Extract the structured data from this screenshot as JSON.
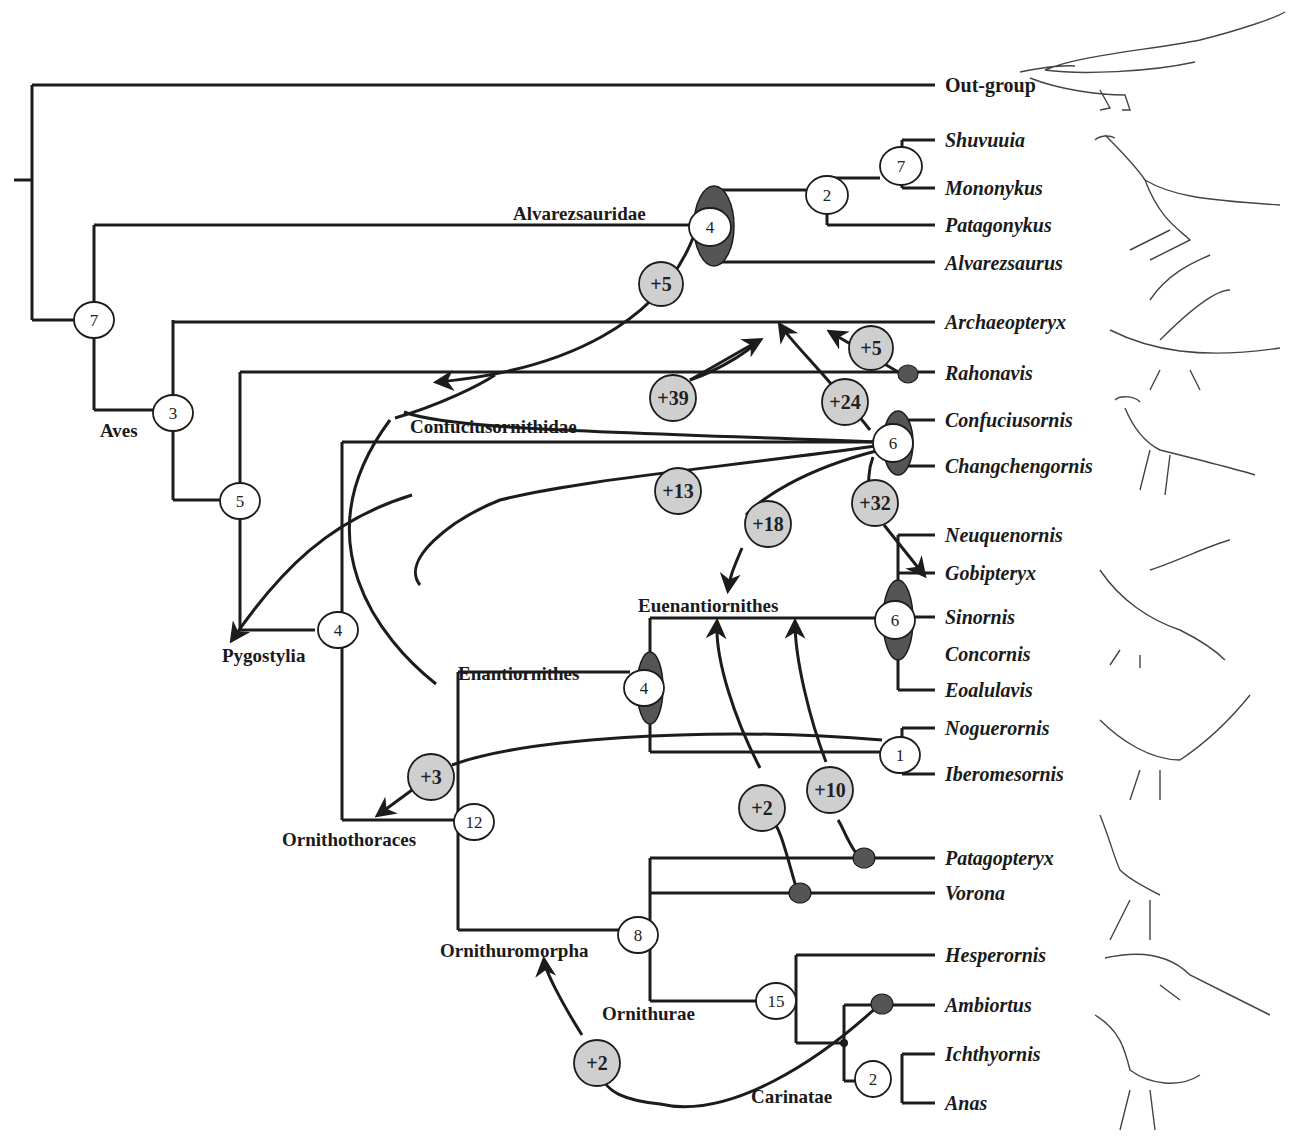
{
  "diagram": {
    "type": "cladogram",
    "outgroup_label": "Out-group",
    "taxa": [
      {
        "name": "Shuvuuia"
      },
      {
        "name": "Mononykus"
      },
      {
        "name": "Patagonykus"
      },
      {
        "name": "Alvarezsaurus"
      },
      {
        "name": "Archaeopteryx"
      },
      {
        "name": "Rahonavis"
      },
      {
        "name": "Confuciusornis"
      },
      {
        "name": "Changchengornis"
      },
      {
        "name": "Neuquenornis"
      },
      {
        "name": "Gobipteryx"
      },
      {
        "name": "Sinornis"
      },
      {
        "name": "Concornis"
      },
      {
        "name": "Eoalulavis"
      },
      {
        "name": "Noguerornis"
      },
      {
        "name": "Iberomesornis"
      },
      {
        "name": "Patagopteryx"
      },
      {
        "name": "Vorona"
      },
      {
        "name": "Hesperornis"
      },
      {
        "name": "Ambiortus"
      },
      {
        "name": "Ichthyornis"
      },
      {
        "name": "Anas"
      }
    ],
    "clades": [
      {
        "name": "Alvarezsauridae"
      },
      {
        "name": "Aves"
      },
      {
        "name": "Confuciusornithidae"
      },
      {
        "name": "Pygostylia"
      },
      {
        "name": "Euenantiornithes"
      },
      {
        "name": "Enantiornithes"
      },
      {
        "name": "Ornithothoraces"
      },
      {
        "name": "Ornithuromorpha"
      },
      {
        "name": "Ornithurae"
      },
      {
        "name": "Carinatae"
      }
    ],
    "node_support": {
      "root_aves_alvarez": "7",
      "aves": "3",
      "pygostylia_above_rahonavis": "5",
      "pygostylia": "4",
      "alvarezsauridae": "4",
      "patagonykus_node": "2",
      "shuvuuia_mononykus": "7",
      "confuciusornithidae": "6",
      "euenantiornithes": "6",
      "enantiornithes": "4",
      "noguerornis_iberomesornis": "1",
      "ornithothoraces": "12",
      "ornithuromorpha": "8",
      "ornithurae": "15",
      "ichthyornis_anas": "2"
    },
    "extra_steps": {
      "alvarezsauridae_move": "+5",
      "rahonavis_move": "+5",
      "confucius_to_archaeopteryx_a": "+39",
      "confucius_to_archaeopteryx_b": "+24",
      "confucius_to_enantiornithes": "+13",
      "confucius_to_euenantiornithes": "+18",
      "confucius_to_gobipteryx": "+32",
      "noguerornis_move": "+3",
      "vorona_move": "+2",
      "patagopteryx_move": "+10",
      "ambiortus_move": "+2"
    }
  }
}
